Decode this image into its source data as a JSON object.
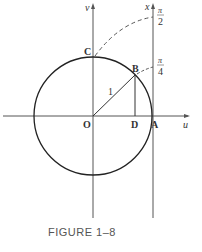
{
  "figure": {
    "caption": "FIGURE 1–8",
    "axes": {
      "horizontal": "u",
      "vertical": "v",
      "right_axis": "x"
    },
    "points": {
      "origin": "O",
      "A": "A",
      "B": "B",
      "C": "C",
      "D": "D"
    },
    "radius_label": "1",
    "right_axis_ticks": [
      {
        "numerator": "π",
        "denominator": "2"
      },
      {
        "numerator": "π",
        "denominator": "4"
      }
    ],
    "colors": {
      "stroke": "#222222",
      "axis": "#555555",
      "text": "#333333"
    }
  }
}
